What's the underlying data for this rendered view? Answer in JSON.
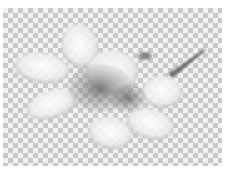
{
  "image": {
    "subject": "white flower with five petals and a stem on transparent checkerboard background",
    "icon": "flower-image",
    "colors": {
      "petal": "#f4f4f4",
      "petal_shadow": "#9a9a9a",
      "center": "#6e6e6e",
      "stem": "#5a5a5a",
      "checker_light": "#f2f2f2",
      "checker_dark": "#c9c9c9"
    }
  }
}
